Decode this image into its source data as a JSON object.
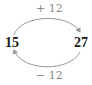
{
  "diagram": {
    "left_value": "15",
    "right_value": "27",
    "top_arrow": {
      "label": "+ 12",
      "from": "15",
      "to": "27"
    },
    "bottom_arrow": {
      "label": "− 12",
      "from": "27",
      "to": "15"
    },
    "colors": {
      "arrow": "#9a9a9a",
      "label": "#888888",
      "number": "#1a1a1a"
    }
  }
}
